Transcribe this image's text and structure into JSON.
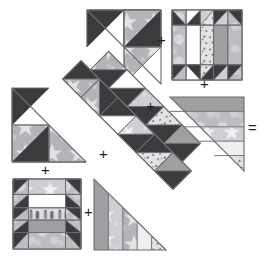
{
  "diagram": {
    "type": "quilt-piecing-diagram",
    "palette": {
      "dark": "#3b3a3c",
      "dark_alt": "#47464a",
      "medium_gray": "#9b9a9e",
      "star_print": "#b9b8bc",
      "light_print": "#d5d4d8",
      "cream": "#ebe9ea",
      "white": "#ffffff",
      "outline": "#6d6c70",
      "ink": "#231f20"
    },
    "operators": [
      {
        "id": "plus-top-right",
        "symbol": "+",
        "x": 160,
        "y": 40,
        "size": 15
      },
      {
        "id": "plus-right-mid",
        "symbol": "+",
        "x": 199,
        "y": 82,
        "size": 15
      },
      {
        "id": "plus-center-right",
        "symbol": "+",
        "x": 148,
        "y": 104,
        "size": 15
      },
      {
        "id": "plus-center-left",
        "symbol": "+",
        "x": 101,
        "y": 152,
        "size": 15
      },
      {
        "id": "plus-bottom-left",
        "symbol": "+",
        "x": 43,
        "y": 168,
        "size": 15
      },
      {
        "id": "plus-bottom-mid",
        "symbol": "+",
        "x": 86,
        "y": 209,
        "size": 15
      },
      {
        "id": "equals-right",
        "symbol": "=",
        "x": 249,
        "y": 125,
        "size": 15
      }
    ],
    "units": [
      {
        "id": "unit-top-triangle",
        "name": "top half-square-triangle unit",
        "shape": "right-triangle",
        "x": 87,
        "y": 10,
        "w": 72,
        "h": 72,
        "patches": 4
      },
      {
        "id": "unit-top-right-block",
        "name": "top right five-column sashed block",
        "shape": "square",
        "x": 172,
        "y": 10,
        "w": 69,
        "h": 69,
        "columns": 5,
        "rows": 3
      },
      {
        "id": "unit-left-triangle",
        "name": "left half-square-triangle unit",
        "shape": "right-triangle",
        "x": 12,
        "y": 88,
        "w": 72,
        "h": 72,
        "patches": 4
      },
      {
        "id": "unit-center-diagonal",
        "name": "center diagonal pieced band",
        "shape": "diagonal-band",
        "x": 50,
        "y": 48,
        "w": 150,
        "h": 150,
        "patches": 8
      },
      {
        "id": "unit-right-triangle",
        "name": "right striped triangle unit",
        "shape": "right-triangle",
        "x": 170,
        "y": 97,
        "w": 72,
        "h": 72,
        "stripes": 5
      },
      {
        "id": "unit-bottom-left-block",
        "name": "bottom left sashed square block",
        "shape": "square",
        "x": 13,
        "y": 179,
        "w": 66,
        "h": 68,
        "columns": 3,
        "rows": 5
      },
      {
        "id": "unit-bottom-triangle",
        "name": "bottom striped triangle unit",
        "shape": "right-triangle",
        "x": 94,
        "y": 179,
        "w": 70,
        "h": 69,
        "stripes": 5
      }
    ]
  }
}
